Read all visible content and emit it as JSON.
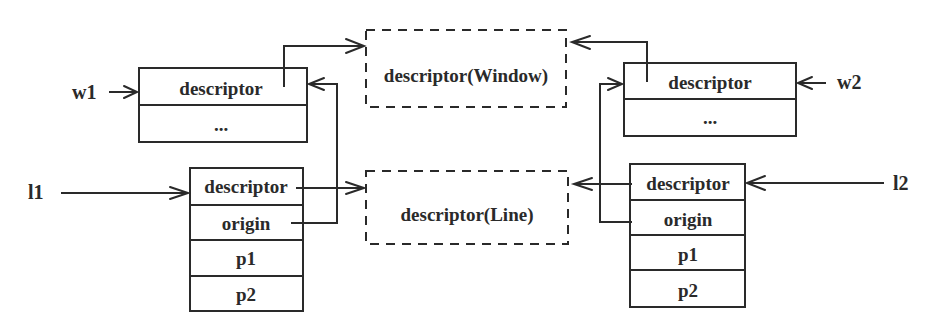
{
  "diagram": {
    "type": "memory-structure-pointer-diagram",
    "pointers": {
      "w1": "w1",
      "w2": "w2",
      "l1": "l1",
      "l2": "l2"
    },
    "shared_descriptors": {
      "window": "descriptor(Window)",
      "line": "descriptor(Line)"
    },
    "objects": {
      "w1": {
        "fields": [
          "descriptor",
          "..."
        ]
      },
      "w2": {
        "fields": [
          "descriptor",
          "..."
        ]
      },
      "l1": {
        "fields": [
          "descriptor",
          "origin",
          "p1",
          "p2"
        ]
      },
      "l2": {
        "fields": [
          "descriptor",
          "origin",
          "p1",
          "p2"
        ]
      }
    },
    "edges": [
      {
        "from": "w1",
        "to": "w1.descriptor"
      },
      {
        "from": "w1.descriptor",
        "to": "descriptor(Window)"
      },
      {
        "from": "w2",
        "to": "w2.descriptor"
      },
      {
        "from": "w2.descriptor",
        "to": "descriptor(Window)"
      },
      {
        "from": "l1",
        "to": "l1.descriptor"
      },
      {
        "from": "l1.descriptor",
        "to": "descriptor(Line)"
      },
      {
        "from": "l1.origin",
        "to": "w1"
      },
      {
        "from": "l2",
        "to": "l2.descriptor"
      },
      {
        "from": "l2.descriptor",
        "to": "descriptor(Line)"
      },
      {
        "from": "l2.origin",
        "to": "w2"
      }
    ]
  }
}
